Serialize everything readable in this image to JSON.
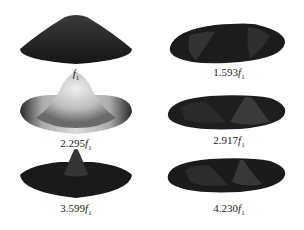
{
  "figure": {
    "modes": [
      {
        "id": "mode-1",
        "coef": "",
        "unit": "f",
        "subscript": "1",
        "text": "f1"
      },
      {
        "id": "mode-2",
        "coef": "1.593",
        "unit": "f",
        "subscript": "1",
        "text": "1.593f1"
      },
      {
        "id": "mode-3",
        "coef": "2.295",
        "unit": "f",
        "subscript": "1",
        "text": "2.295f1"
      },
      {
        "id": "mode-4",
        "coef": "2.917",
        "unit": "f",
        "subscript": "1",
        "text": "2.917f1"
      },
      {
        "id": "mode-5",
        "coef": "3.599",
        "unit": "f",
        "subscript": "1",
        "text": "3.599f1"
      },
      {
        "id": "mode-6",
        "coef": "4.230",
        "unit": "f",
        "subscript": "1",
        "text": "4.230f1"
      }
    ],
    "colors": {
      "shape_dark": "#1a1a1a",
      "shape_mid": "#4a4a4a",
      "shape_light": "#d8d8d8",
      "background": "#ffffff"
    }
  }
}
